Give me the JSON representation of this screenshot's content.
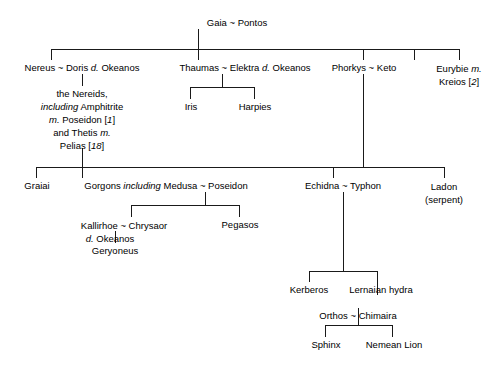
{
  "diagram": {
    "line_color": "#1a1a1a",
    "background": "#ffffff"
  },
  "nodes": {
    "gaia_pontos": "Gaia ~ Pontos",
    "nereus_doris": "Nereus ~ Doris",
    "nereus_doris_qualifier": "d.",
    "nereus_doris_okeanos": " Okeanos",
    "nereids_line1": "the Nereids,",
    "nereids_including": "including",
    "nereids_amphitrite": " Amphitrite",
    "nereids_m1": "m.",
    "nereids_poseidon": " Poseidon [",
    "nereids_ref1": "1",
    "nereids_close1": "]",
    "nereids_and_thetis": "and Thetis ",
    "nereids_m2": "m.",
    "nereids_pelias": "Pelias [",
    "nereids_ref2": "18",
    "nereids_close2": "]",
    "thaumas_elektra": "Thaumas ~ Elektra ",
    "thaumas_qualifier": "d.",
    "thaumas_okeanos": " Okeanos",
    "iris": "Iris",
    "harpies": "Harpies",
    "phorkys_keto": "Phorkys ~ Keto",
    "eurybie": "Eurybie ",
    "eurybie_m": "m.",
    "eurybie_kreios": "Kreios [",
    "eurybie_ref": "2",
    "eurybie_close": "]",
    "graiai": "Graiai",
    "gorgons_prefix": "Gorgons ",
    "gorgons_including": "including",
    "gorgons_suffix": " Medusa ~ Poseidon",
    "echidna_typhon": "Echidna ~ Typhon",
    "ladon_name": "Ladon",
    "ladon_note": "(serpent)",
    "kallirhoe_chrysaor": "Kallirhoe ~ Chrysaor",
    "kallirhoe_qualifier": "d.",
    "kallirhoe_okeanos": " Okeanos",
    "geryoneus": "Geryoneus",
    "pegasos": "Pegasos",
    "kerberos": "Kerberos",
    "lernaian_hydra": "Lernaian hydra",
    "orthos_chimaira": "Orthos ~ Chimaira",
    "sphinx": "Sphinx",
    "nemean_lion": "Nemean Lion"
  }
}
